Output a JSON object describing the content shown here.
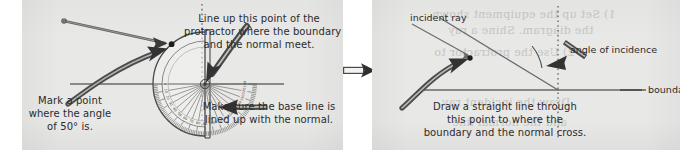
{
  "figure": {
    "type": "two-step instructional diagram",
    "background_color": "#e8e8e6",
    "ink_color": "#2b2b2b"
  },
  "left_panel": {
    "name": "step-1-protractor",
    "callouts": {
      "top_right": {
        "line1": "Line up this point of the",
        "line2": "protractor where the boundary",
        "line3": "and the normal meet."
      },
      "bottom_left": {
        "line1": "Mark a point",
        "line2": "where the angle",
        "line3": "of 50° is."
      },
      "bottom_right": {
        "line1": "Make sure the base line is",
        "line2": "lined up with the normal."
      }
    },
    "angle_value": "50°",
    "protractor": {
      "orientation": "semicircle opening left, flat base vertical on right",
      "major_ticks_every_deg": 10,
      "minor_ticks_every_deg": 2,
      "tick_labels": [
        "0",
        "10",
        "20",
        "30",
        "40",
        "50",
        "60",
        "70",
        "80",
        "90",
        "100",
        "110",
        "120",
        "130",
        "140",
        "150",
        "160",
        "170",
        "180"
      ]
    },
    "elements": {
      "normal_line": "vertical dotted line",
      "boundary_line": "horizontal solid line",
      "marked_point": "dot at 50 degrees on protractor rim"
    }
  },
  "transition": {
    "name": "step-arrow",
    "direction": "right",
    "style": "outlined shaft with solid head"
  },
  "right_panel": {
    "name": "step-2-incident-ray",
    "labels": {
      "incident_ray": "incident ray",
      "angle_of_incidence": "angle of incidence",
      "boundary": "boundary"
    },
    "callout_bottom": {
      "line1": "Draw a straight line through",
      "line2": "this point to where the",
      "line3": "boundary and the normal cross."
    },
    "elements": {
      "normal_line": "vertical dotted line",
      "boundary_line": "horizontal solid line",
      "ray_line": "straight ray from upper left to intersection point",
      "angle_arc": "arc between ray and normal",
      "marked_point": "dot on the ray"
    }
  },
  "ghost_text": {
    "note": "faint show-through text from reverse of page",
    "lines": [
      "1) Set up the equipment shown",
      "the diagram. Shine a ray",
      "2) Use the protractor to",
      "Draw the incident ray",
      "and the normal line"
    ]
  }
}
